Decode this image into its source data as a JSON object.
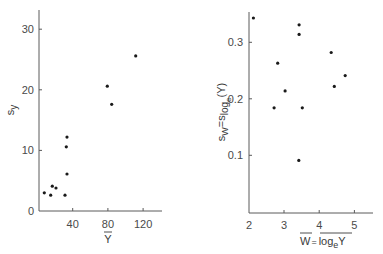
{
  "chart_data": [
    {
      "type": "scatter",
      "title": "",
      "xlabel": "Ȳ",
      "ylabel": "s_Y",
      "xlim": [
        -2,
        140
      ],
      "ylim": [
        0,
        33
      ],
      "xticks": [
        40,
        80,
        120
      ],
      "yticks": [
        0,
        10,
        20,
        30
      ],
      "grid": false,
      "legend": null,
      "points": [
        {
          "x": 7.7,
          "y": 3.0
        },
        {
          "x": 15.0,
          "y": 2.6
        },
        {
          "x": 16.8,
          "y": 4.1
        },
        {
          "x": 21.0,
          "y": 3.8
        },
        {
          "x": 31.3,
          "y": 2.6
        },
        {
          "x": 33.5,
          "y": 6.1
        },
        {
          "x": 32.7,
          "y": 10.6
        },
        {
          "x": 33.5,
          "y": 12.2
        },
        {
          "x": 79.3,
          "y": 20.6
        },
        {
          "x": 84.3,
          "y": 17.6
        },
        {
          "x": 111.6,
          "y": 25.6
        }
      ]
    },
    {
      "type": "scatter",
      "title": "",
      "xlabel": "W̄ = mean(log_e Y)",
      "ylabel": "s_W = s_log_e(Y)",
      "xlim": [
        2,
        5.5
      ],
      "ylim": [
        0,
        0.35
      ],
      "xticks": [
        2,
        3,
        4,
        5
      ],
      "yticks": [
        0.1,
        0.2,
        0.3
      ],
      "grid": false,
      "legend": null,
      "points": [
        {
          "x": 2.13,
          "y": 0.343
        },
        {
          "x": 2.72,
          "y": 0.184
        },
        {
          "x": 2.82,
          "y": 0.263
        },
        {
          "x": 3.03,
          "y": 0.214
        },
        {
          "x": 3.42,
          "y": 0.091
        },
        {
          "x": 3.43,
          "y": 0.314
        },
        {
          "x": 3.43,
          "y": 0.331
        },
        {
          "x": 3.52,
          "y": 0.184
        },
        {
          "x": 4.34,
          "y": 0.282
        },
        {
          "x": 4.43,
          "y": 0.222
        },
        {
          "x": 4.74,
          "y": 0.241
        }
      ]
    }
  ],
  "left": {
    "ylabel_main": "s",
    "ylabel_sub": "y",
    "xlabel": "Y",
    "tick_labels_x": [
      "40",
      "80",
      "120"
    ],
    "tick_labels_y": [
      "0",
      "10",
      "20",
      "30"
    ]
  },
  "right": {
    "ylabel_s1": "s",
    "ylabel_w": "W",
    "ylabel_eq": "=s",
    "ylabel_log": "log",
    "ylabel_e": "e",
    "ylabel_arg": "(Y)",
    "xlabel_w": "W",
    "xlabel_eq": "=",
    "xlabel_log": "log",
    "xlabel_e": "e",
    "xlabel_y": "Y",
    "tick_labels_x": [
      "2",
      "3",
      "4",
      "5"
    ],
    "tick_labels_y": [
      "0.1",
      "0.2",
      "0.3"
    ]
  },
  "style": {
    "axis_color": "#5a5a5a",
    "point_color": "#1a1a1a"
  }
}
